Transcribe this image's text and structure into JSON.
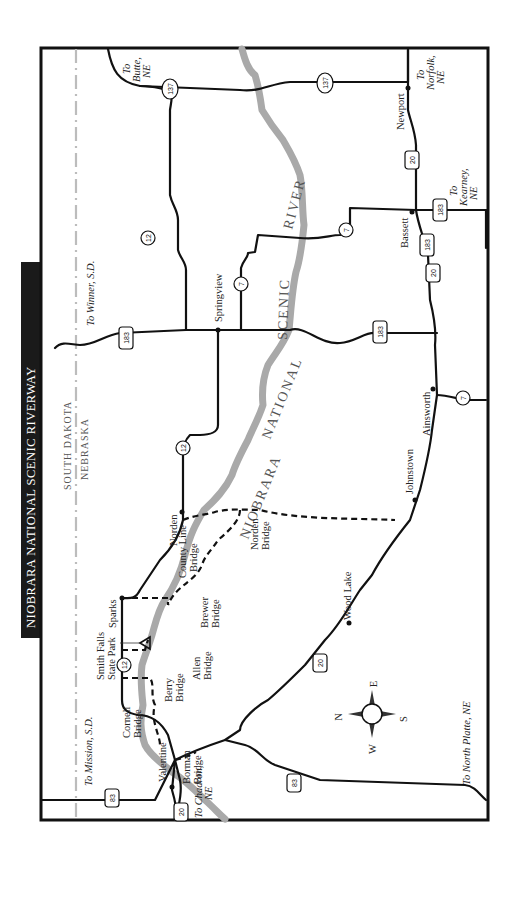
{
  "title": "NIOBRARA NATIONAL SCENIC RIVERWAY",
  "states": {
    "north": "SOUTH DAKOTA",
    "south": "NEBRASKA"
  },
  "river_label": [
    "NIOBRARA",
    "NATIONAL",
    "SCENIC",
    "RIVER"
  ],
  "towns": {
    "valentine": "Valentine",
    "sparks": "Sparks",
    "norden": "Norden",
    "springview": "Springview",
    "johnstown": "Johnstown",
    "ainsworth": "Ainsworth",
    "wood_lake": "Wood Lake",
    "bassett": "Bassett",
    "newport": "Newport"
  },
  "bridges": {
    "borman": [
      "Borman",
      "Bridge"
    ],
    "cornell": [
      "Cornell",
      "Bridge"
    ],
    "berry": [
      "Berry",
      "Bridge"
    ],
    "allen": [
      "Allen",
      "Bridge"
    ],
    "brewer": [
      "Brewer",
      "Bridge"
    ],
    "county_line": [
      "County Line",
      "Bridge"
    ],
    "norden": [
      "Norden",
      "Bridge"
    ]
  },
  "park": [
    "Smith Falls",
    "State Park"
  ],
  "directions": {
    "butte": [
      "To",
      "Butte,",
      "NE"
    ],
    "norfolk": [
      "To",
      "Norfolk,",
      "NE"
    ],
    "kearney": [
      "To",
      "Kearney,",
      "NE"
    ],
    "winner": "To Winner, S.D.",
    "mission": "To Mission, S.D.",
    "chadron": [
      "To Chadron,",
      "NE"
    ],
    "north_platte": "To North Platte, NE"
  },
  "routes": {
    "us83": "83",
    "us20": "20",
    "us183": "183",
    "ne12": "12",
    "ne7": "7",
    "ne137": "137"
  },
  "compass": {
    "n": "N",
    "e": "E",
    "s": "S",
    "w": "W"
  },
  "colors": {
    "river": "#a9a9a9",
    "road": "#111111",
    "border": "#bcbcbc",
    "title_bg": "#1a1a1a"
  }
}
